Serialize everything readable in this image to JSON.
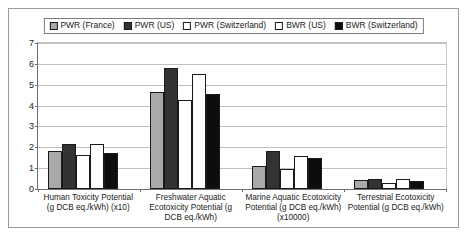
{
  "chart_data": {
    "type": "bar",
    "title": "",
    "xlabel": "",
    "ylabel": "",
    "ylim": [
      0,
      7
    ],
    "ytick_labels": [
      "0",
      "1",
      "2",
      "3",
      "4",
      "5",
      "6",
      "7"
    ],
    "grid": true,
    "legend_position": "top-center",
    "categories": [
      "Human Toxicity Potential (g DCB eq./kWh) (x10)",
      "Freshwater Aquatic Ecotoxicity Potential (g DCB eq./kWh)",
      "Marine Aquatic Ecotoxicity Potential (g DCB eq./kWh) (x10000)",
      "Terrestrial Ecotoxicity Potential (g DCB eq./kWh)"
    ],
    "series": [
      {
        "name": "PWR (France)",
        "color": "#a9a9a9",
        "values": [
          1.82,
          4.65,
          1.1,
          0.45
        ]
      },
      {
        "name": "PWR (US)",
        "color": "#333333",
        "values": [
          2.18,
          5.8,
          1.8,
          0.5
        ]
      },
      {
        "name": "PWR (Switzerland)",
        "color": "#ffffff",
        "values": [
          1.65,
          4.25,
          0.97,
          0.3
        ]
      },
      {
        "name": "BWR (US)",
        "color": "#fdfdfd",
        "values": [
          2.15,
          5.5,
          1.6,
          0.5
        ]
      },
      {
        "name": "BWR (Switzerland)",
        "color": "#0d0d0d",
        "values": [
          1.74,
          4.55,
          1.5,
          0.4
        ]
      }
    ]
  }
}
